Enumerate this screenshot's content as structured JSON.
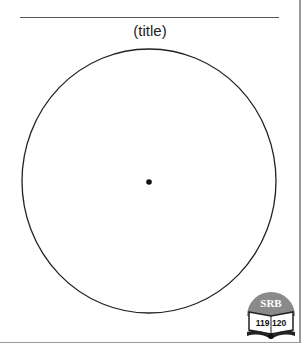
{
  "diagram": {
    "title": "(title)",
    "shape": "circle",
    "center_point": true
  },
  "logo": {
    "top_text": "SRB",
    "page_numbers": "119 120",
    "accent_color": "#8a8a8a"
  }
}
